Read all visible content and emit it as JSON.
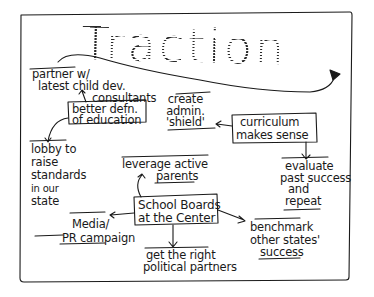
{
  "diagram": {
    "title": "Traction",
    "central_node": {
      "line1": "School Boards",
      "line2": "at the Center"
    },
    "nodes": {
      "partner": {
        "line1": "partner w/",
        "line2": "latest child dev.",
        "line3": "consultants"
      },
      "better_defn": {
        "line1": "better defn.",
        "line2": "of education"
      },
      "lobby": {
        "line1": "lobby to",
        "line2": "raise",
        "line3": "standards",
        "line4": "in our",
        "line5": "state"
      },
      "create_admin": {
        "line1": "create",
        "line2": "admin.",
        "line3": "'shield'"
      },
      "curriculum": {
        "line1": "curriculum",
        "line2": "makes sense"
      },
      "evaluate": {
        "line1": "evaluate",
        "line2": "past success",
        "line3": "and",
        "line4": "repeat"
      },
      "leverage": {
        "line1": "leverage active",
        "line2": "parents"
      },
      "media": {
        "line1": "Media/",
        "line2": "PR campaign"
      },
      "benchmark": {
        "line1": "benchmark",
        "line2": "other states'",
        "line3": "success"
      },
      "political": {
        "line1": "get the right",
        "line2": "political partners"
      }
    },
    "edges": [
      {
        "from": "better_defn",
        "to": "partner"
      },
      {
        "from": "better_defn",
        "to": "lobby"
      },
      {
        "from": "curriculum",
        "to": "create_admin"
      },
      {
        "from": "curriculum",
        "to": "evaluate"
      },
      {
        "from": "central_node",
        "to": "leverage"
      },
      {
        "from": "central_node",
        "to": "media"
      },
      {
        "from": "central_node",
        "to": "benchmark"
      },
      {
        "from": "central_node",
        "to": "political"
      }
    ],
    "colors": {
      "ink": "#1a1a1a",
      "paper": "#ffffff"
    }
  }
}
